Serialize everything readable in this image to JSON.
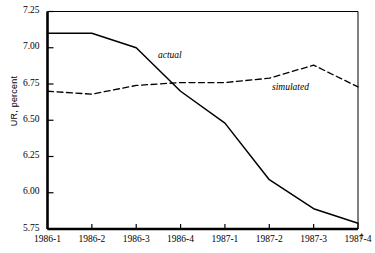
{
  "chart_data": {
    "type": "line",
    "title": "",
    "xlabel": "t",
    "ylabel": "UR, percent",
    "categories": [
      "1986-1",
      "1986-2",
      "1986-3",
      "1986-4",
      "1987-1",
      "1987-2",
      "1987-3",
      "1987-4"
    ],
    "ylim": [
      5.75,
      7.25
    ],
    "yticks": [
      "5.75",
      "6.00",
      "6.25",
      "6.50",
      "6.75",
      "7.00",
      "7.25"
    ],
    "ytick_values": [
      5.75,
      6.0,
      6.25,
      6.5,
      6.75,
      7.0,
      7.25
    ],
    "grid": false,
    "legend_position": "inline-annotation",
    "series": [
      {
        "name": "actual",
        "style": "solid",
        "color": "#000000",
        "values": [
          7.1,
          7.1,
          7.0,
          6.7,
          6.48,
          6.09,
          5.89,
          5.79
        ]
      },
      {
        "name": "simulated",
        "style": "dashed",
        "color": "#000000",
        "values": [
          6.7,
          6.68,
          6.74,
          6.76,
          6.76,
          6.79,
          6.88,
          6.73
        ]
      }
    ],
    "annotations": [
      {
        "text": "actual",
        "series": "actual"
      },
      {
        "text": "simulated",
        "series": "simulated"
      }
    ]
  },
  "axis": {
    "y_title": "UR, percent",
    "x_axis_symbol": "t"
  },
  "labels": {
    "actual": "actual",
    "simulated": "simulated"
  }
}
